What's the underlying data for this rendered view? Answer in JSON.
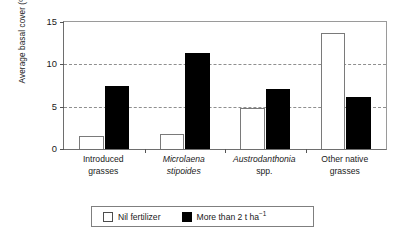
{
  "chart_data": {
    "type": "bar",
    "title": "",
    "xlabel": "",
    "ylabel": "Average basal cover (%)",
    "ylim": [
      0,
      15
    ],
    "yticks": [
      0,
      5,
      10,
      15
    ],
    "ytick_labels": [
      "0",
      "5",
      "10",
      "15"
    ],
    "gridlines_at": [
      5,
      10
    ],
    "grid": "horizontal-dashed",
    "legend_position": "below-axes",
    "categories": [
      "Introduced grasses",
      "Microlaena stipoides",
      "Austrodanthonia spp.",
      "Other native grasses"
    ],
    "category_lines": [
      {
        "line1": "Introduced",
        "line2": "grasses",
        "italic": false
      },
      {
        "line1": "Microlaena",
        "line2": "stipoides",
        "italic": true
      },
      {
        "line1": "Austrodanthonia",
        "line2": "spp.",
        "italic": true,
        "line2_roman": true
      },
      {
        "line1": "Other native",
        "line2": "grasses",
        "italic": false
      }
    ],
    "series": [
      {
        "name": "Nil fertilizer",
        "color": "#ffffff",
        "edge_color": "#7a7a7a",
        "values": [
          1.5,
          1.8,
          4.8,
          13.7
        ]
      },
      {
        "name": "More than 2 t ha−1",
        "color": "#000000",
        "edge_color": "#000000",
        "values": [
          7.5,
          11.3,
          7.1,
          6.2
        ]
      }
    ]
  },
  "legend": {
    "entries": [
      {
        "label": "Nil fertilizer"
      },
      {
        "label_prefix": "More than 2 t ha",
        "label_sup": "−1"
      }
    ]
  },
  "axis": {
    "y_title": "Average basal cover (%)",
    "y_tick_0": "0",
    "y_tick_1": "5",
    "y_tick_2": "10",
    "y_tick_3": "15"
  }
}
